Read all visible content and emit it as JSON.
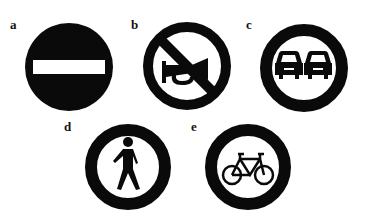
{
  "figure": {
    "signs": [
      {
        "label": "a",
        "meaning": "no-entry"
      },
      {
        "label": "b",
        "meaning": "no-horn"
      },
      {
        "label": "c",
        "meaning": "no-overtaking"
      },
      {
        "label": "d",
        "meaning": "no-pedestrians"
      },
      {
        "label": "e",
        "meaning": "no-bicycles"
      }
    ],
    "colors": {
      "ink": "#0a0a0a",
      "background": "#ffffff"
    }
  }
}
